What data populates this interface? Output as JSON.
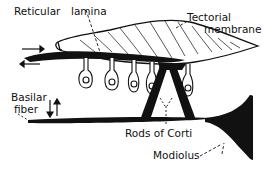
{
  "diagram": {
    "labels": {
      "reticular": "Reticular",
      "lamina": "lamina",
      "tectorial_line1": "Tectorial",
      "tectorial_line2": "membrane",
      "basilar_line1": "Basilar",
      "basilar_line2": "fiber",
      "rods": "Rods of Corti",
      "modiolus": "Modiolus"
    },
    "colors": {
      "ink": "#111111",
      "background": "#ffffff"
    },
    "hair_cell_count": 5,
    "arrows": {
      "horizontal": [
        "right",
        "left"
      ],
      "vertical": [
        "down",
        "up"
      ]
    }
  }
}
